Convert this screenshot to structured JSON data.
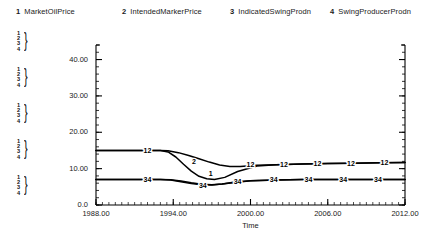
{
  "legend": {
    "items": [
      {
        "num": "1",
        "label": "MarketOilPrice",
        "x": 16
      },
      {
        "num": "2",
        "label": "IntendedMarkerPrice",
        "x": 122
      },
      {
        "num": "3",
        "label": "IndicatedSwingProdn",
        "x": 230
      },
      {
        "num": "4",
        "label": "SwingProducerProdn",
        "x": 330
      }
    ]
  },
  "axis_stacks": [
    {
      "y": 31,
      "rows": [
        "1",
        "2",
        "3",
        "4"
      ]
    },
    {
      "y": 67,
      "rows": [
        "1",
        "2",
        "3",
        "4"
      ]
    },
    {
      "y": 103,
      "rows": [
        "1",
        "2",
        "3",
        "4"
      ]
    },
    {
      "y": 139,
      "rows": [
        "1",
        "2",
        "3",
        "4"
      ]
    },
    {
      "y": 175,
      "rows": [
        "1",
        "2",
        "3",
        "4"
      ]
    }
  ],
  "chart_data": {
    "type": "line",
    "title": "",
    "xlabel": "Time",
    "ylabel": "",
    "xlim": [
      1988,
      2012
    ],
    "ylim": [
      0,
      44
    ],
    "grid": false,
    "legend_position": "top",
    "ytick_labels": [
      "40.00",
      "30.00",
      "20.00",
      "10.00",
      "0.0"
    ],
    "ytick_values": [
      40,
      30,
      20,
      10,
      0
    ],
    "xtick_labels": [
      "1988.00",
      "1994.00",
      "2000.00",
      "2006.00",
      "2012.00"
    ],
    "xtick_values": [
      1988,
      1994,
      2000,
      2006,
      2012
    ],
    "series": [
      {
        "name": "MarketOilPrice",
        "key": "1",
        "x": [
          1988,
          1990,
          1992,
          1993,
          1993.6,
          1994.2,
          1994.8,
          1995.4,
          1996,
          1996.6,
          1997.2,
          1998,
          1999,
          2000.5,
          2002,
          2004,
          2006,
          2008,
          2010,
          2012
        ],
        "y": [
          15.0,
          15.0,
          15.0,
          15.0,
          14.6,
          13.2,
          11.2,
          9.3,
          7.9,
          7.2,
          7.0,
          7.6,
          9.2,
          10.7,
          11.1,
          11.3,
          11.4,
          11.5,
          11.6,
          11.7
        ]
      },
      {
        "name": "IntendedMarkerPrice",
        "key": "2",
        "x": [
          1988,
          1990,
          1992,
          1993,
          1993.6,
          1994.4,
          1995.2,
          1996,
          1996.8,
          1997.6,
          1998.4,
          1999.2,
          2000.5,
          2002,
          2004,
          2006,
          2008,
          2010,
          2012
        ],
        "y": [
          15.0,
          15.0,
          15.0,
          15.0,
          14.9,
          14.4,
          13.6,
          12.7,
          11.8,
          11.0,
          10.6,
          10.6,
          10.9,
          11.1,
          11.3,
          11.4,
          11.5,
          11.6,
          11.7
        ]
      },
      {
        "name": "IndicatedSwingProdn",
        "key": "3",
        "x": [
          1988,
          1990,
          1992,
          1993,
          1993.8,
          1994.6,
          1995.4,
          1996.2,
          1997,
          1997.8,
          1998.8,
          2000,
          2002,
          2004,
          2006,
          2008,
          2010,
          2012
        ],
        "y": [
          7.0,
          7.0,
          7.0,
          7.0,
          6.9,
          6.4,
          5.9,
          5.6,
          5.5,
          5.8,
          6.3,
          6.7,
          6.9,
          7.0,
          7.0,
          7.0,
          7.0,
          7.0
        ]
      },
      {
        "name": "SwingProducerProdn",
        "key": "4",
        "x": [
          1988,
          1990,
          1992,
          1993,
          1993.8,
          1994.6,
          1995.4,
          1996.2,
          1997,
          1997.8,
          1998.8,
          2000,
          2002,
          2004,
          2006,
          2008,
          2010,
          2012
        ],
        "y": [
          7.0,
          7.0,
          7.0,
          7.0,
          6.95,
          6.6,
          6.1,
          5.7,
          5.55,
          5.75,
          6.2,
          6.65,
          6.9,
          7.0,
          7.0,
          7.0,
          7.0,
          7.0
        ]
      }
    ],
    "point_labels_upper": [
      {
        "x": 1992.0,
        "y": 15.0,
        "text": "12"
      },
      {
        "x": 1995.6,
        "y": 12.1,
        "text": "2"
      },
      {
        "x": 2000.0,
        "y": 11.1,
        "text": "12"
      },
      {
        "x": 2002.6,
        "y": 11.3,
        "text": "12"
      },
      {
        "x": 2005.2,
        "y": 11.4,
        "text": "12"
      },
      {
        "x": 2007.8,
        "y": 11.5,
        "text": "12"
      },
      {
        "x": 2010.4,
        "y": 11.6,
        "text": "12"
      }
    ],
    "point_labels_lower": [
      {
        "x": 1992.0,
        "y": 7.0,
        "text": "34"
      },
      {
        "x": 1996.3,
        "y": 5.5,
        "text": "34"
      },
      {
        "x": 1999.0,
        "y": 6.6,
        "text": "34"
      },
      {
        "x": 2001.8,
        "y": 7.0,
        "text": "34"
      },
      {
        "x": 2004.5,
        "y": 7.0,
        "text": "34"
      },
      {
        "x": 2007.2,
        "y": 7.0,
        "text": "34"
      },
      {
        "x": 2009.9,
        "y": 7.0,
        "text": "34"
      }
    ],
    "inline_labels_extra": [
      {
        "x": 1996.9,
        "y": 8.6,
        "text": "1"
      }
    ]
  },
  "colors": {
    "line": "#000000",
    "axis": "#000000",
    "text": "#1a1a1a",
    "background": "#ffffff"
  }
}
